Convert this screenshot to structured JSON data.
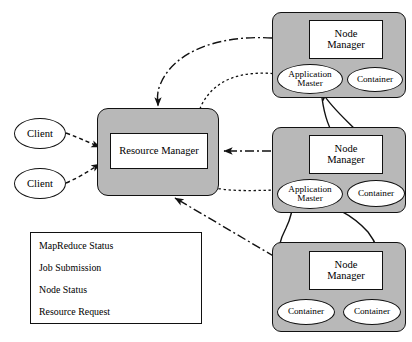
{
  "diagram": {
    "colors": {
      "panel_fill": "#b8b8b8",
      "box_fill": "#ffffff",
      "stroke": "#111111",
      "background": "#ffffff"
    },
    "clients": [
      {
        "label": "Client"
      },
      {
        "label": "Client"
      }
    ],
    "resource_manager": {
      "label": "Resource Manager"
    },
    "nodes": [
      {
        "manager_line1": "Node",
        "manager_line2": "Manager",
        "children": [
          {
            "type": "application-master",
            "line1": "Application",
            "line2": "Master"
          },
          {
            "type": "container",
            "label": "Container"
          }
        ]
      },
      {
        "manager_line1": "Node",
        "manager_line2": "Manager",
        "children": [
          {
            "type": "application-master",
            "line1": "Application",
            "line2": "Master"
          },
          {
            "type": "container",
            "label": "Container"
          }
        ]
      },
      {
        "manager_line1": "Node",
        "manager_line2": "Manager",
        "children": [
          {
            "type": "container",
            "label": "Container"
          },
          {
            "type": "container",
            "label": "Container"
          }
        ]
      }
    ],
    "legend": {
      "items": [
        {
          "label": "MapReduce Status",
          "style": "solid"
        },
        {
          "label": "Job Submission",
          "style": "dashed"
        },
        {
          "label": "Node Status",
          "style": "dash-dot"
        },
        {
          "label": "Resource Request",
          "style": "dotted"
        }
      ]
    }
  }
}
